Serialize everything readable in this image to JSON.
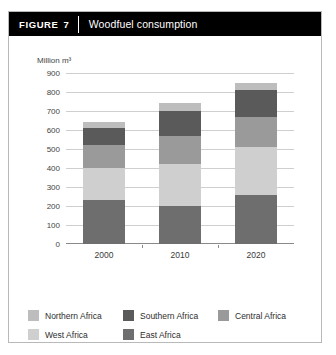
{
  "figure": {
    "tag_word": "FIGURE",
    "tag_number": "7",
    "title": "Woodfuel consumption"
  },
  "chart_data": {
    "type": "bar",
    "stacked": true,
    "title": "Woodfuel consumption",
    "xlabel": "",
    "ylabel": "Million m³",
    "axis_unit_label": "Million m³",
    "categories": [
      "2000",
      "2010",
      "2020"
    ],
    "ylim": [
      0,
      900
    ],
    "ytick_step": 100,
    "yticks": [
      0,
      100,
      200,
      300,
      400,
      500,
      600,
      700,
      800,
      900
    ],
    "ytick_labels": [
      "0",
      "100",
      "200",
      "300",
      "400",
      "500",
      "600",
      "700",
      "800",
      "900"
    ],
    "grid": true,
    "legend_position": "bottom",
    "series": [
      {
        "name": "East Africa",
        "values": [
          230,
          200,
          260
        ],
        "color": "#6e6e6e"
      },
      {
        "name": "West Africa",
        "values": [
          170,
          220,
          250
        ],
        "color": "#cfcfcf"
      },
      {
        "name": "Central Africa",
        "values": [
          120,
          150,
          160
        ],
        "color": "#9a9a9a"
      },
      {
        "name": "Southern Africa",
        "values": [
          90,
          130,
          140
        ],
        "color": "#5a5a5a"
      },
      {
        "name": "Northern Africa",
        "values": [
          30,
          40,
          40
        ],
        "color": "#bdbdbd"
      }
    ],
    "totals": [
      640,
      740,
      850
    ]
  },
  "legend": {
    "rows": [
      [
        {
          "label": "Northern Africa",
          "color": "#bdbdbd"
        },
        {
          "label": "Southern Africa",
          "color": "#5a5a5a"
        },
        {
          "label": "Central Africa",
          "color": "#9a9a9a"
        }
      ],
      [
        {
          "label": "West Africa",
          "color": "#cfcfcf"
        },
        {
          "label": "East Africa",
          "color": "#6e6e6e"
        }
      ]
    ]
  }
}
